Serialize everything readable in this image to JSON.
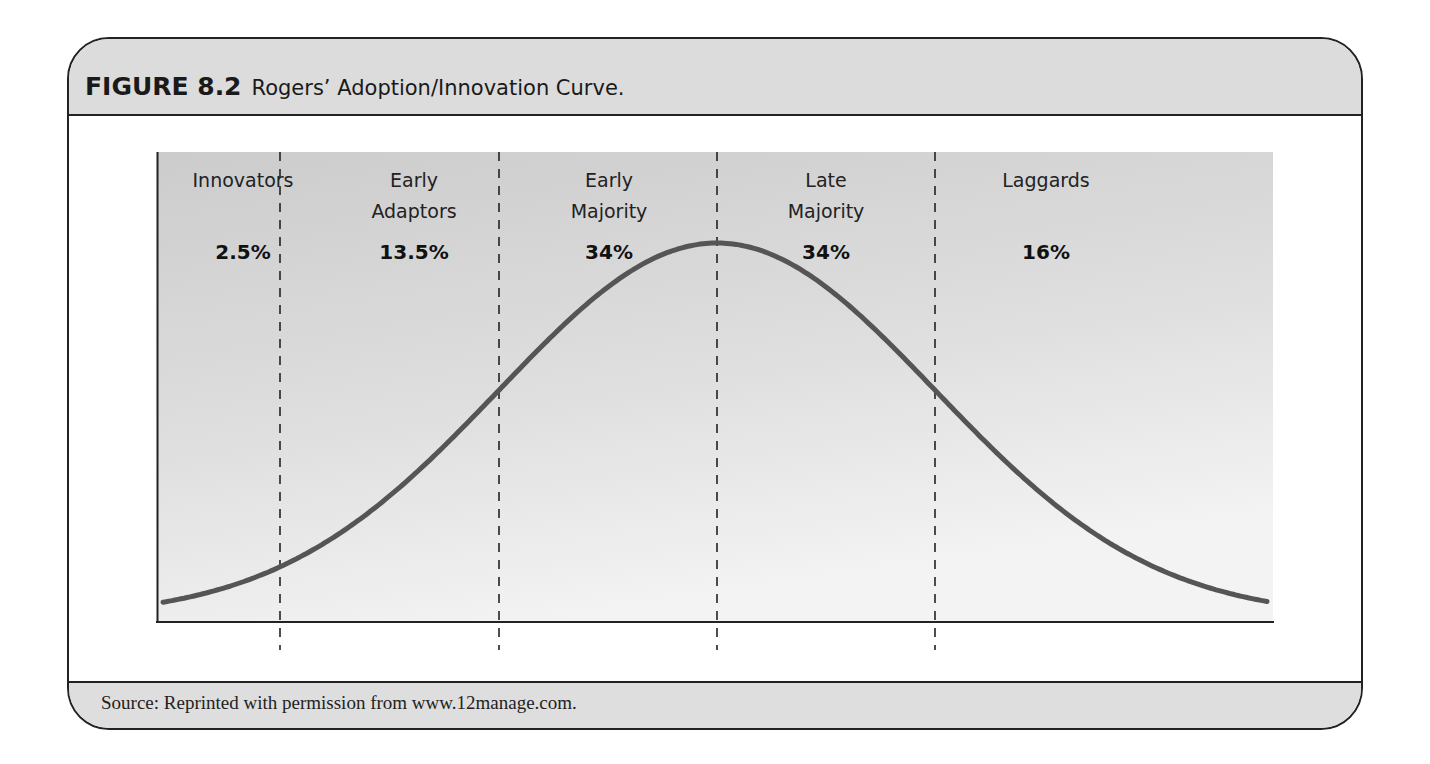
{
  "figure": {
    "label": "FIGURE 8.2",
    "caption": "Rogers’ Adoption/Innovation Curve.",
    "source": "Source: Reprinted with permission from www.12manage.com."
  },
  "colors": {
    "curve": "#555555",
    "panel_top": "#cdcdcd",
    "panel_bottom": "#f2f2f2",
    "header_bg": "#dcdcdc",
    "border": "#222222"
  },
  "segments": [
    {
      "name_line1": "Innovators",
      "name_line2": "",
      "percent": "2.5%"
    },
    {
      "name_line1": "Early",
      "name_line2": "Adaptors",
      "percent": "13.5%"
    },
    {
      "name_line1": "Early",
      "name_line2": "Majority",
      "percent": "34%"
    },
    {
      "name_line1": "Late",
      "name_line2": "Majority",
      "percent": "34%"
    },
    {
      "name_line1": "Laggards",
      "name_line2": "",
      "percent": "16%"
    }
  ],
  "chart_data": {
    "type": "line",
    "title": "Rogers’ Adoption/Innovation Curve",
    "subtitle": "",
    "xlabel": "",
    "ylabel": "",
    "grid": false,
    "legend": "none",
    "categories": [
      "Innovators",
      "Early Adaptors",
      "Early Majority",
      "Late Majority",
      "Laggards"
    ],
    "values": [
      2.5,
      13.5,
      34,
      34,
      16
    ],
    "value_unit": "%",
    "dividers_sd": [
      -2,
      -1,
      0,
      1
    ],
    "curve": {
      "shape": "normal",
      "x_sd_range": [
        -3.4,
        3.4
      ],
      "peak_at_sd": 0
    }
  }
}
